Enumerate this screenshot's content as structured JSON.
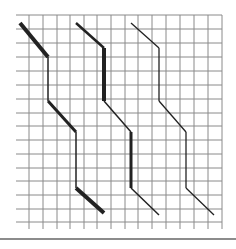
{
  "figure": {
    "grid": {
      "left": 16,
      "top": 15,
      "right": 222,
      "bottom": 222,
      "vertical_lines_x": [
        29,
        43,
        57,
        70,
        84,
        97,
        111,
        125,
        138,
        152,
        166,
        180,
        194,
        208,
        222
      ],
      "horizontal_lines_y": [
        15,
        29,
        43,
        57,
        71,
        85,
        99,
        113,
        126,
        140,
        154,
        168,
        181,
        195,
        209,
        222
      ],
      "tick_bottom": 229,
      "line_color": "#8a8a8a"
    },
    "paths": [
      {
        "name": "path-1",
        "segments": [
          {
            "points": "20,23 48,57",
            "width": 4
          },
          {
            "points": "48,57 48,101",
            "width": 1.5
          },
          {
            "points": "48,101 76,132",
            "width": 3
          },
          {
            "points": "76,132 76,188",
            "width": 1.5
          },
          {
            "points": "76,188 104,213",
            "width": 4
          }
        ]
      },
      {
        "name": "path-2",
        "segments": [
          {
            "points": "76,23 104,48",
            "width": 2.5
          },
          {
            "points": "104,48 104,101",
            "width": 4
          },
          {
            "points": "104,101 131,132",
            "width": 1.5
          },
          {
            "points": "131,132 131,188",
            "width": 3
          },
          {
            "points": "131,188 159,215",
            "width": 1.5
          }
        ]
      },
      {
        "name": "path-3",
        "segments": [
          {
            "points": "131,23 159,48",
            "width": 1.3
          },
          {
            "points": "159,48 159,101",
            "width": 1.3
          },
          {
            "points": "159,101 186,132",
            "width": 1.3
          },
          {
            "points": "186,132 186,188",
            "width": 1.3
          },
          {
            "points": "186,188 214,215",
            "width": 1.3
          }
        ]
      }
    ],
    "stroke_color": "#222222",
    "bottom_rule_color": "#8c8c8c"
  }
}
